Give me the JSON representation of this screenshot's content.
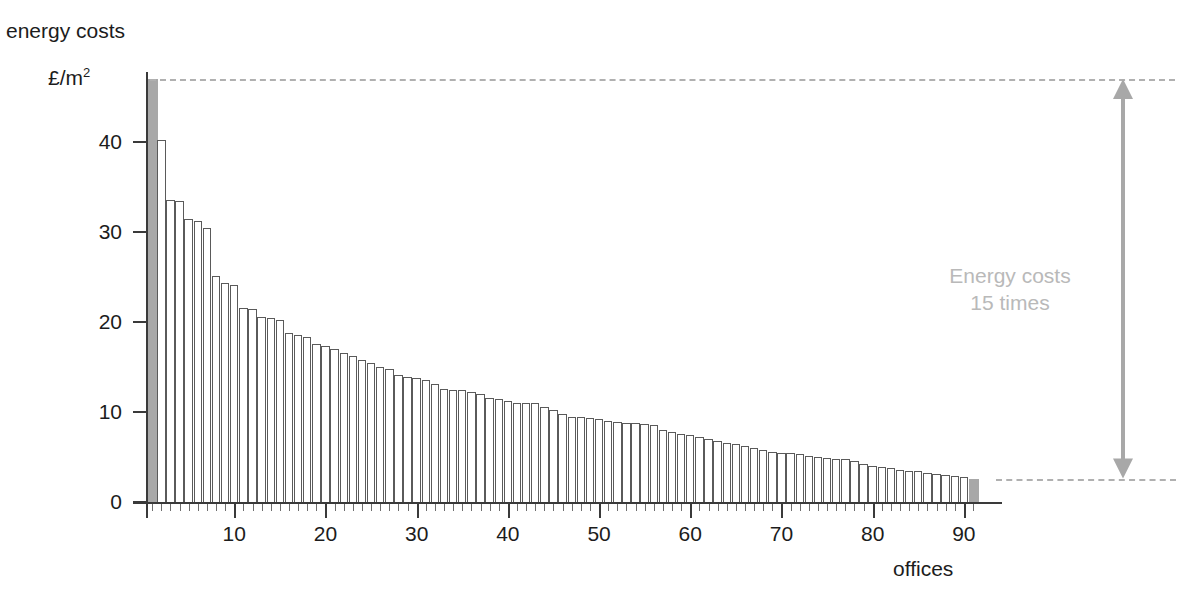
{
  "chart": {
    "title": "energy costs",
    "ylabel": "£/m",
    "ylabel_exponent": "2",
    "xlabel": "offices",
    "annotation_line1": "Energy costs",
    "annotation_line2": "15 times"
  },
  "colors": {
    "axis": "#3a3a3a",
    "bar_outline": "#5a5a5a",
    "bar_highlight_fill": "#a8a8a8",
    "guide_dashed": "#b0b0b0",
    "arrow": "#a8a8a8",
    "annotation_text": "#b9b9b9",
    "text": "#1c1c1c",
    "background": "#ffffff"
  },
  "chart_data": {
    "type": "bar",
    "title": "energy costs",
    "xlabel": "offices",
    "ylabel": "£/m2",
    "ylim": [
      0,
      48
    ],
    "xlim": [
      0,
      92
    ],
    "grid": false,
    "legend": null,
    "yticks": [
      0,
      10,
      20,
      30,
      40
    ],
    "ytick_labels": [
      "0",
      "10",
      "20",
      "30",
      "40"
    ],
    "xticks": [
      10,
      20,
      30,
      40,
      50,
      60,
      70,
      80,
      90
    ],
    "xtick_labels": [
      "10",
      "20",
      "30",
      "40",
      "50",
      "60",
      "70",
      "80",
      "90"
    ],
    "annotations": [
      {
        "text": "Energy costs 15 times",
        "kind": "double-headed-arrow-with-label",
        "from_value": 2.6,
        "to_value": 47.0,
        "ratio": 15
      }
    ],
    "highlighted_bars": [
      1,
      91
    ],
    "n_bars": 91,
    "categories": [
      1,
      2,
      3,
      4,
      5,
      6,
      7,
      8,
      9,
      10,
      11,
      12,
      13,
      14,
      15,
      16,
      17,
      18,
      19,
      20,
      21,
      22,
      23,
      24,
      25,
      26,
      27,
      28,
      29,
      30,
      31,
      32,
      33,
      34,
      35,
      36,
      37,
      38,
      39,
      40,
      41,
      42,
      43,
      44,
      45,
      46,
      47,
      48,
      49,
      50,
      51,
      52,
      53,
      54,
      55,
      56,
      57,
      58,
      59,
      60,
      61,
      62,
      63,
      64,
      65,
      66,
      67,
      68,
      69,
      70,
      71,
      72,
      73,
      74,
      75,
      76,
      77,
      78,
      79,
      80,
      81,
      82,
      83,
      84,
      85,
      86,
      87,
      88,
      89,
      90,
      91
    ],
    "values": [
      47.0,
      40.2,
      33.6,
      33.4,
      31.4,
      31.2,
      30.4,
      25.1,
      24.3,
      24.1,
      21.6,
      21.4,
      20.6,
      20.4,
      20.2,
      18.8,
      18.6,
      18.3,
      17.6,
      17.3,
      17.0,
      16.6,
      16.2,
      15.8,
      15.5,
      15.0,
      14.8,
      14.1,
      13.9,
      13.8,
      13.6,
      13.1,
      12.6,
      12.5,
      12.4,
      12.2,
      12.0,
      11.6,
      11.4,
      11.2,
      11.0,
      11.0,
      11.0,
      10.6,
      10.2,
      9.8,
      9.5,
      9.4,
      9.3,
      9.2,
      9.0,
      8.9,
      8.8,
      8.8,
      8.7,
      8.6,
      8.0,
      7.8,
      7.6,
      7.4,
      7.2,
      7.0,
      6.8,
      6.6,
      6.4,
      6.2,
      6.0,
      5.8,
      5.6,
      5.5,
      5.4,
      5.3,
      5.1,
      5.0,
      4.9,
      4.8,
      4.8,
      4.6,
      4.2,
      4.0,
      3.9,
      3.8,
      3.6,
      3.5,
      3.4,
      3.2,
      3.1,
      3.0,
      2.9,
      2.8,
      2.6
    ]
  }
}
